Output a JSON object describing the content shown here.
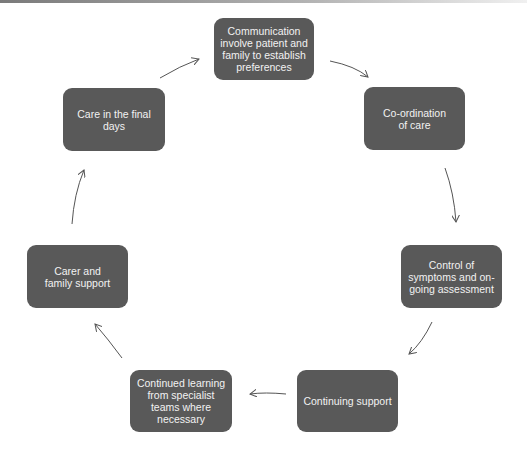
{
  "diagram": {
    "type": "cycle",
    "nodes": [
      {
        "id": "communication",
        "label": "Communication involve patient and family to establish preferences"
      },
      {
        "id": "coordination",
        "label": "Co-ordination of care"
      },
      {
        "id": "control",
        "label": "Control of symptoms and on-going assessment"
      },
      {
        "id": "continuing",
        "label": "Continuing support"
      },
      {
        "id": "learning",
        "label": "Continued learning from specialist teams where necessary"
      },
      {
        "id": "carer",
        "label": "Carer and family support"
      },
      {
        "id": "final",
        "label": "Care in the final days"
      }
    ],
    "edges": [
      [
        "communication",
        "coordination"
      ],
      [
        "coordination",
        "control"
      ],
      [
        "control",
        "continuing"
      ],
      [
        "continuing",
        "learning"
      ],
      [
        "learning",
        "carer"
      ],
      [
        "carer",
        "final"
      ],
      [
        "final",
        "communication"
      ]
    ],
    "colors": {
      "node_fill": "#595959",
      "node_text": "#f2f2f2",
      "arrow": "#555555",
      "background": "#ffffff"
    }
  }
}
